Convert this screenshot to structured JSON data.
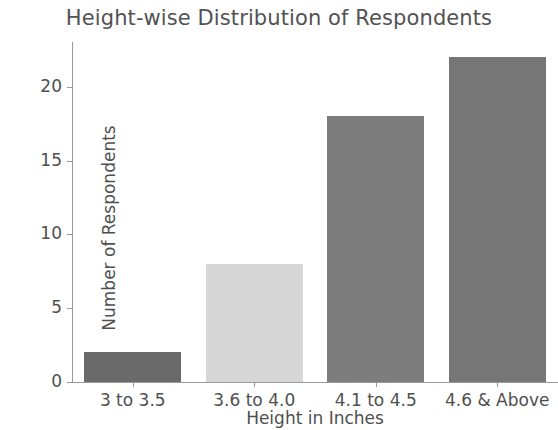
{
  "chart_data": {
    "type": "bar",
    "title": "Height-wise Distribution of Respondents",
    "xlabel": "Height in Inches",
    "ylabel": "Number of Respondents",
    "categories": [
      "3 to 3.5",
      "3.6 to 4.0",
      "4.1 to 4.5",
      "4.6 & Above"
    ],
    "values": [
      2,
      8,
      18,
      22
    ],
    "bar_colors": [
      "#6a6a6a",
      "#d6d6d6",
      "#7d7d7d",
      "#767676"
    ],
    "ylim": [
      0,
      23.1
    ],
    "yticks": [
      0,
      5,
      10,
      15,
      20
    ],
    "ytick_labels": [
      "0",
      "5",
      "10",
      "15",
      "20"
    ],
    "grid": false,
    "legend": "none",
    "background": "#ffffff",
    "axis_color": "#9a9a9a",
    "text_color": "#4f4f4f"
  }
}
